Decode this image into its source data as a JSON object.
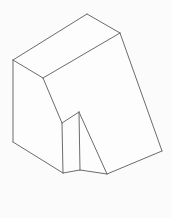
{
  "figure": {
    "type": "isometric-line-drawing",
    "canvas": {
      "width": 171,
      "height": 218
    },
    "background_color": "#fbfbfb",
    "line_color": "#6b6b70",
    "face_color": "#fdfdfd",
    "line_width": 1.0
  },
  "vertices": {
    "left_top": [
      13,
      60
    ],
    "left_bottom": [
      13,
      142
    ],
    "top_apex": [
      87,
      14
    ],
    "right_top": [
      120,
      33
    ],
    "right_bottom": [
      162,
      151
    ],
    "mid_junction": [
      43,
      78
    ],
    "notch_top": [
      79,
      112
    ],
    "notch_left_top": [
      62,
      123
    ],
    "notch_left_bottom": [
      63,
      173
    ],
    "notch_inner_bottom": [
      80,
      170
    ],
    "notch_right_bottom": [
      107,
      174
    ],
    "front_bottom_left": [
      63,
      173
    ]
  },
  "faces": [
    {
      "name": "top-face",
      "points": "13,60 87,14 120,33 43,78"
    },
    {
      "name": "left-side-face",
      "points": "13,60 43,78 62,123 63,173 13,142"
    },
    {
      "name": "inclined-front-face",
      "points": "43,78 120,33 162,151 107,174 79,112 62,123"
    },
    {
      "name": "notch-left-wall",
      "points": "62,123 79,112 80,170 63,173"
    },
    {
      "name": "notch-bottom-wall",
      "points": "79,112 107,174 80,170"
    }
  ],
  "edges": [
    {
      "name": "top-back-left-edge",
      "from": [
        13,
        60
      ],
      "to": [
        87,
        14
      ]
    },
    {
      "name": "top-back-right-edge",
      "from": [
        87,
        14
      ],
      "to": [
        120,
        33
      ]
    },
    {
      "name": "top-front-right-edge",
      "from": [
        120,
        33
      ],
      "to": [
        43,
        78
      ]
    },
    {
      "name": "top-front-left-edge",
      "from": [
        43,
        78
      ],
      "to": [
        13,
        60
      ]
    },
    {
      "name": "left-vertical-edge",
      "from": [
        13,
        60
      ],
      "to": [
        13,
        142
      ]
    },
    {
      "name": "left-bottom-edge",
      "from": [
        13,
        142
      ],
      "to": [
        63,
        173
      ]
    },
    {
      "name": "mid-slope-edge",
      "from": [
        43,
        78
      ],
      "to": [
        62,
        123
      ]
    },
    {
      "name": "notch-left-vertical-edge",
      "from": [
        62,
        123
      ],
      "to": [
        63,
        173
      ]
    },
    {
      "name": "notch-top-edge",
      "from": [
        62,
        123
      ],
      "to": [
        79,
        112
      ]
    },
    {
      "name": "notch-inner-vertical-edge",
      "from": [
        79,
        112
      ],
      "to": [
        80,
        170
      ]
    },
    {
      "name": "notch-floor-front-edge",
      "from": [
        63,
        173
      ],
      "to": [
        80,
        170
      ]
    },
    {
      "name": "notch-diagonal-edge",
      "from": [
        79,
        112
      ],
      "to": [
        107,
        174
      ]
    },
    {
      "name": "notch-floor-right-edge",
      "from": [
        80,
        170
      ],
      "to": [
        107,
        174
      ]
    },
    {
      "name": "bottom-right-edge",
      "from": [
        107,
        174
      ],
      "to": [
        162,
        151
      ]
    },
    {
      "name": "right-slope-edge",
      "from": [
        120,
        33
      ],
      "to": [
        162,
        151
      ]
    }
  ]
}
